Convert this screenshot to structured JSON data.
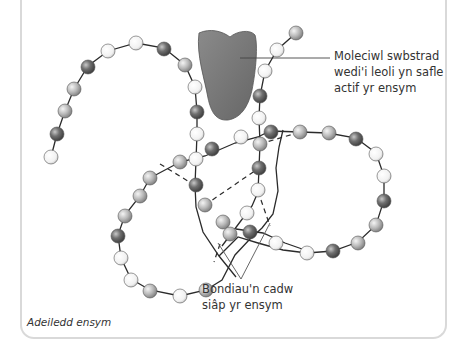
{
  "figure": {
    "caption": "Adeiledd ensym",
    "labels": {
      "substrate": "Moleciwl swbstrad\nwedi'i leoli yn safle\nactif yr ensym",
      "bonds": "Bondiau'n cadw\nsiâp yr ensym"
    },
    "colors": {
      "substrate_fill": "#7a7a7a",
      "bead_dark": "#5e5e5e",
      "bead_mid": "#b3b3b3",
      "bead_light": "#f2f2f2",
      "chain": "#2b2b2b",
      "card_border": "#d9d9d9"
    }
  }
}
